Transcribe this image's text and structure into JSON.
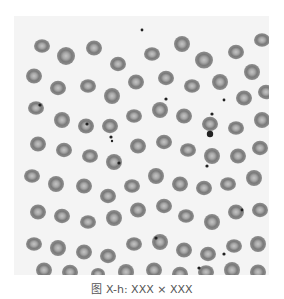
{
  "figure": {
    "background_color": "#f4f4f4",
    "cell_color": "#7d7d7d",
    "cell_center_color": "#b8b8b8",
    "platelet_color": "#222222",
    "cells": [
      [
        28,
        30,
        8
      ],
      [
        52,
        40,
        9
      ],
      [
        80,
        32,
        8
      ],
      [
        104,
        48,
        8
      ],
      [
        138,
        38,
        8
      ],
      [
        168,
        28,
        8
      ],
      [
        190,
        44,
        9
      ],
      [
        222,
        36,
        8
      ],
      [
        248,
        24,
        8
      ],
      [
        238,
        56,
        8
      ],
      [
        20,
        60,
        8
      ],
      [
        44,
        72,
        8
      ],
      [
        74,
        70,
        8
      ],
      [
        98,
        80,
        8
      ],
      [
        122,
        66,
        8
      ],
      [
        152,
        62,
        8
      ],
      [
        178,
        70,
        8
      ],
      [
        206,
        66,
        8
      ],
      [
        230,
        82,
        8
      ],
      [
        252,
        76,
        8
      ],
      [
        22,
        92,
        8
      ],
      [
        48,
        104,
        8
      ],
      [
        72,
        110,
        8
      ],
      [
        96,
        110,
        8
      ],
      [
        120,
        100,
        8
      ],
      [
        146,
        94,
        8
      ],
      [
        170,
        100,
        8
      ],
      [
        196,
        108,
        8
      ],
      [
        222,
        112,
        8
      ],
      [
        248,
        104,
        8
      ],
      [
        24,
        128,
        8
      ],
      [
        50,
        134,
        8
      ],
      [
        76,
        140,
        8
      ],
      [
        100,
        146,
        8
      ],
      [
        124,
        130,
        8
      ],
      [
        150,
        126,
        8
      ],
      [
        174,
        134,
        8
      ],
      [
        198,
        140,
        8
      ],
      [
        224,
        140,
        8
      ],
      [
        246,
        132,
        8
      ],
      [
        18,
        160,
        8
      ],
      [
        42,
        168,
        8
      ],
      [
        70,
        170,
        8
      ],
      [
        94,
        180,
        8
      ],
      [
        118,
        170,
        8
      ],
      [
        142,
        160,
        8
      ],
      [
        166,
        168,
        8
      ],
      [
        190,
        172,
        8
      ],
      [
        214,
        168,
        8
      ],
      [
        240,
        162,
        8
      ],
      [
        24,
        196,
        8
      ],
      [
        48,
        200,
        8
      ],
      [
        74,
        206,
        8
      ],
      [
        100,
        202,
        8
      ],
      [
        124,
        194,
        8
      ],
      [
        150,
        190,
        8
      ],
      [
        172,
        200,
        8
      ],
      [
        198,
        206,
        8
      ],
      [
        222,
        196,
        8
      ],
      [
        246,
        194,
        8
      ],
      [
        20,
        228,
        8
      ],
      [
        44,
        232,
        8
      ],
      [
        70,
        236,
        8
      ],
      [
        94,
        240,
        8
      ],
      [
        120,
        228,
        8
      ],
      [
        146,
        226,
        8
      ],
      [
        170,
        234,
        8
      ],
      [
        194,
        238,
        8
      ],
      [
        220,
        230,
        8
      ],
      [
        244,
        228,
        8
      ],
      [
        30,
        254,
        8
      ],
      [
        56,
        256,
        8
      ],
      [
        84,
        258,
        7
      ],
      [
        112,
        256,
        8
      ],
      [
        140,
        254,
        8
      ],
      [
        166,
        258,
        8
      ],
      [
        192,
        256,
        8
      ],
      [
        218,
        254,
        8
      ],
      [
        244,
        256,
        8
      ]
    ],
    "platelets": [
      [
        26,
        89,
        1.6
      ],
      [
        73,
        108,
        1.6
      ],
      [
        97,
        121,
        1.6
      ],
      [
        128,
        14,
        1.4
      ],
      [
        152,
        83,
        1.6
      ],
      [
        198,
        98,
        1.6
      ],
      [
        210,
        84,
        1.4
      ],
      [
        98,
        125,
        1.2
      ],
      [
        105,
        147,
        1.6
      ],
      [
        142,
        222,
        1.6
      ],
      [
        193,
        150,
        1.6
      ],
      [
        228,
        194,
        1.4
      ],
      [
        210,
        238,
        1.6
      ],
      [
        185,
        252,
        1.6
      ],
      [
        196,
        118,
        3.2
      ]
    ]
  },
  "caption": {
    "text": "图 X-h: XXX × XXX"
  }
}
